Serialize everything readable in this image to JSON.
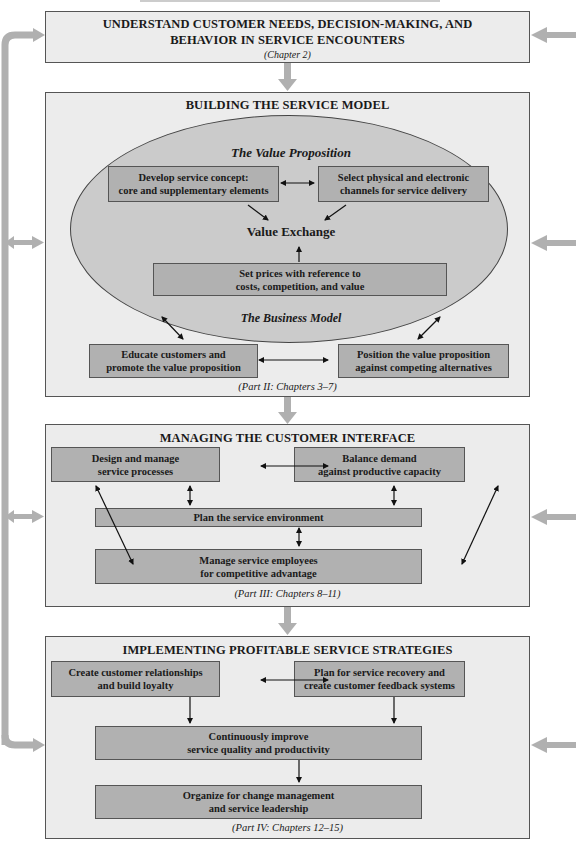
{
  "figure": {
    "header_fragment": "...(cropped figure caption)...",
    "top_box": {
      "title_line1": "UNDERSTAND CUSTOMER NEEDS, DECISION-MAKING, AND",
      "title_line2": "BEHAVIOR IN SERVICE ENCOUNTERS",
      "caption": "(Chapter 2)"
    },
    "service_model": {
      "title": "BUILDING THE SERVICE MODEL",
      "value_proposition_label": "The Value Proposition",
      "business_model_label": "The Business Model",
      "value_exchange_label": "Value Exchange",
      "boxes": {
        "develop_concept": [
          "Develop service concept:",
          "core and supplementary elements"
        ],
        "select_channels": [
          "Select physical and electronic",
          "channels for service delivery"
        ],
        "set_prices": [
          "Set prices with reference to",
          "costs, competition, and value"
        ],
        "educate": [
          "Educate customers and",
          "promote the value proposition"
        ],
        "position": [
          "Position the value proposition",
          "against competing alternatives"
        ]
      },
      "caption": "(Part II: Chapters 3–7)"
    },
    "customer_interface": {
      "title": "MANAGING THE CUSTOMER INTERFACE",
      "boxes": {
        "design_processes": [
          "Design and manage",
          "service processes"
        ],
        "balance_demand": [
          "Balance demand",
          "against productive capacity"
        ],
        "plan_environment": [
          "Plan the service environment"
        ],
        "manage_employees": [
          "Manage service employees",
          "for competitive advantage"
        ]
      },
      "caption": "(Part III: Chapters 8–11)"
    },
    "profitable_strategies": {
      "title": "IMPLEMENTING PROFITABLE SERVICE STRATEGIES",
      "boxes": {
        "relationships": [
          "Create customer relationships",
          "and build loyalty"
        ],
        "recovery": [
          "Plan for service recovery and",
          "create customer feedback systems"
        ],
        "improve_quality": [
          "Continuously improve",
          "service quality and productivity"
        ],
        "change_management": [
          "Organize for change management",
          "and service leadership"
        ]
      },
      "caption": "(Part IV: Chapters 12–15)"
    },
    "colors": {
      "panel_bg": "#ececec",
      "box_fill": "#b1b1b1",
      "ellipse_fill": "#cbcbcb",
      "flow_arrow": "#b0b0b0",
      "border": "#555555"
    }
  }
}
